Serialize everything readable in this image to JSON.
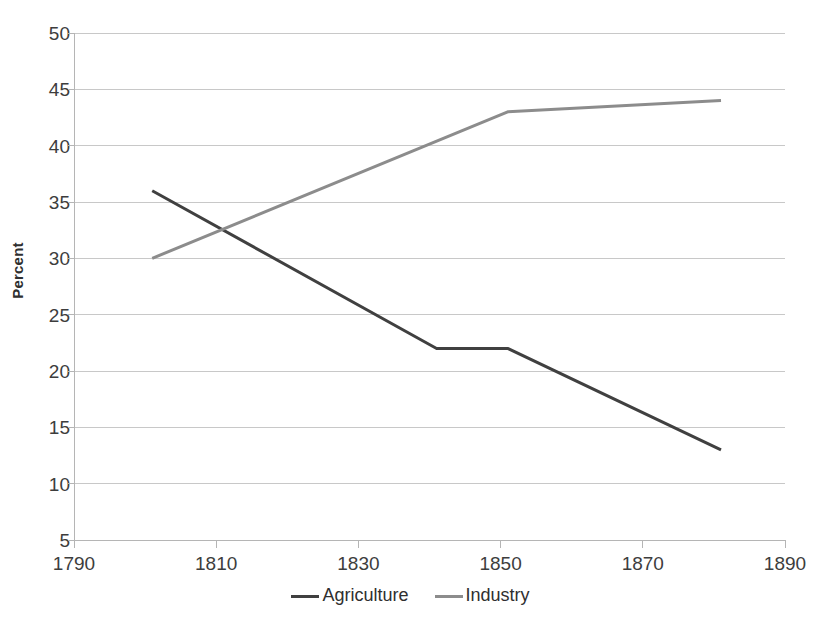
{
  "chart_data": {
    "type": "line",
    "title": "",
    "xlabel": "",
    "ylabel": "Percent",
    "xlim": [
      1790,
      1890
    ],
    "ylim": [
      5,
      50
    ],
    "xticks": [
      1790,
      1810,
      1830,
      1850,
      1870,
      1890
    ],
    "yticks": [
      5,
      10,
      15,
      20,
      25,
      30,
      35,
      40,
      45,
      50
    ],
    "grid": "horizontal",
    "legend_position": "bottom",
    "series": [
      {
        "name": "Agriculture",
        "color": "#404040",
        "x": [
          1801,
          1841,
          1851,
          1881
        ],
        "values": [
          36,
          22,
          22,
          13
        ]
      },
      {
        "name": "Industry",
        "color": "#8c8c8c",
        "x": [
          1801,
          1851,
          1881
        ],
        "values": [
          30,
          43,
          44
        ]
      }
    ]
  },
  "axes": {
    "y_label": "Percent",
    "y_tick_labels": [
      "50",
      "45",
      "40",
      "35",
      "30",
      "25",
      "20",
      "15",
      "10",
      "5"
    ],
    "x_tick_labels": [
      "1790",
      "1810",
      "1830",
      "1850",
      "1870",
      "1890"
    ]
  },
  "legend": {
    "items": [
      {
        "label": "Agriculture",
        "color": "#404040"
      },
      {
        "label": "Industry",
        "color": "#8c8c8c"
      }
    ]
  },
  "colors": {
    "agriculture": "#404040",
    "industry": "#8c8c8c",
    "gridline": "#c8c8c8",
    "axis": "#b5b5b5",
    "text": "#3d3d3d",
    "background": "#ffffff"
  }
}
